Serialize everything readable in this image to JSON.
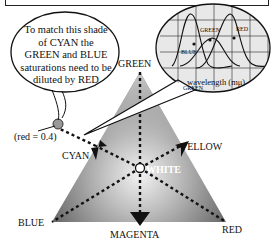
{
  "callout": {
    "text_lines": [
      "To match this shade",
      "of CYAN the",
      "GREEN and BLUE",
      "saturations need to be",
      "diluted by RED"
    ]
  },
  "sample_point": {
    "label": "(red = 0.4)"
  },
  "triangle": {
    "vertices": {
      "top": "GREEN",
      "left": "BLUE",
      "right": "RED"
    },
    "edge_midpoints": {
      "left": "CYAN",
      "right": "YELLOW",
      "bottom": "MAGENTA"
    },
    "center": "WHITE"
  },
  "inset_graph": {
    "xlabel": "wavelength (mμ)",
    "curves": [
      "BLUE",
      "GREEN",
      "RED"
    ],
    "x_ticks": [
      "400",
      "500",
      "600",
      "700"
    ]
  },
  "colors": {
    "triangle_dark": "#4a4a4a",
    "triangle_light": "#e6e6e6",
    "line": "#111111"
  }
}
